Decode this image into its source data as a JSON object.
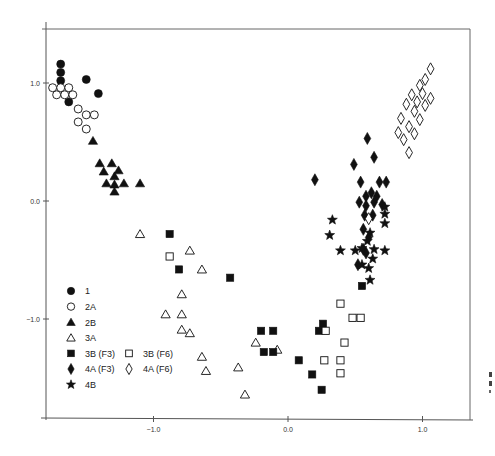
{
  "chart_data": {
    "type": "scatter",
    "title": "",
    "xlabel": "",
    "ylabel": "",
    "xlim": [
      -1.8,
      1.35
    ],
    "ylim": [
      -1.85,
      1.45
    ],
    "grid": false,
    "legend_position": "lower-left inside",
    "x_ticks": [
      {
        "value": -1.0,
        "label": "−1.0"
      },
      {
        "value": 0.0,
        "label": "0.0"
      },
      {
        "value": 1.0,
        "label": "1.0"
      }
    ],
    "y_ticks": [
      {
        "value": 1.0,
        "label": "1.0"
      },
      {
        "value": 0.0,
        "label": "0.0"
      },
      {
        "value": -1.0,
        "label": "−1.0"
      }
    ],
    "series": [
      {
        "name": "1",
        "marker": "circle",
        "filled": true,
        "points": [
          [
            -1.69,
            1.16
          ],
          [
            -1.69,
            1.09
          ],
          [
            -1.69,
            1.02
          ],
          [
            -1.5,
            1.03
          ],
          [
            -1.63,
            0.84
          ],
          [
            -1.41,
            0.91
          ]
        ]
      },
      {
        "name": "2A",
        "marker": "circle",
        "filled": false,
        "points": [
          [
            -1.75,
            0.96
          ],
          [
            -1.69,
            0.96
          ],
          [
            -1.63,
            0.96
          ],
          [
            -1.72,
            0.9
          ],
          [
            -1.66,
            0.9
          ],
          [
            -1.6,
            0.9
          ],
          [
            -1.56,
            0.78
          ],
          [
            -1.5,
            0.73
          ],
          [
            -1.44,
            0.73
          ],
          [
            -1.56,
            0.67
          ],
          [
            -1.5,
            0.61
          ]
        ]
      },
      {
        "name": "2B",
        "marker": "triangle",
        "filled": true,
        "points": [
          [
            -1.45,
            0.51
          ],
          [
            -1.4,
            0.32
          ],
          [
            -1.31,
            0.32
          ],
          [
            -1.37,
            0.25
          ],
          [
            -1.26,
            0.26
          ],
          [
            -1.35,
            0.15
          ],
          [
            -1.29,
            0.21
          ],
          [
            -1.29,
            0.14
          ],
          [
            -1.22,
            0.15
          ],
          [
            -1.1,
            0.15
          ],
          [
            -1.29,
            0.08
          ]
        ]
      },
      {
        "name": "3A",
        "marker": "triangle",
        "filled": false,
        "points": [
          [
            -1.1,
            -0.28
          ],
          [
            -0.73,
            -0.42
          ],
          [
            -0.64,
            -0.58
          ],
          [
            -0.79,
            -0.79
          ],
          [
            -0.91,
            -0.96
          ],
          [
            -0.79,
            -0.96
          ],
          [
            -0.79,
            -1.09
          ],
          [
            -0.73,
            -1.12
          ],
          [
            -0.64,
            -1.32
          ],
          [
            -0.61,
            -1.44
          ],
          [
            -0.37,
            -1.41
          ],
          [
            -0.32,
            -1.64
          ],
          [
            -0.24,
            -1.2
          ],
          [
            -0.08,
            -1.26
          ]
        ]
      },
      {
        "name": "3B (F3)",
        "marker": "square",
        "filled": true,
        "points": [
          [
            -0.88,
            -0.28
          ],
          [
            -0.81,
            -0.58
          ],
          [
            -0.43,
            -0.65
          ],
          [
            -0.2,
            -1.1
          ],
          [
            -0.11,
            -1.1
          ],
          [
            -0.18,
            -1.28
          ],
          [
            -0.11,
            -1.28
          ],
          [
            0.08,
            -1.35
          ],
          [
            0.23,
            -1.1
          ],
          [
            0.26,
            -1.04
          ],
          [
            0.18,
            -1.47
          ],
          [
            0.25,
            -1.6
          ],
          [
            0.55,
            -0.72
          ]
        ]
      },
      {
        "name": "3B (F6)",
        "marker": "square",
        "filled": false,
        "points": [
          [
            -0.88,
            -0.47
          ],
          [
            0.28,
            -1.1
          ],
          [
            0.39,
            -0.87
          ],
          [
            0.48,
            -0.99
          ],
          [
            0.54,
            -0.99
          ],
          [
            0.42,
            -1.2
          ],
          [
            0.39,
            -1.35
          ],
          [
            0.39,
            -1.46
          ],
          [
            0.27,
            -1.35
          ]
        ]
      },
      {
        "name": "4A (F3)",
        "marker": "diamond",
        "filled": true,
        "points": [
          [
            0.2,
            0.18
          ],
          [
            0.49,
            0.31
          ],
          [
            0.59,
            0.53
          ],
          [
            0.64,
            0.37
          ],
          [
            0.54,
            0.16
          ],
          [
            0.68,
            0.16
          ],
          [
            0.73,
            0.16
          ],
          [
            0.58,
            0.04
          ],
          [
            0.62,
            0.07
          ],
          [
            0.66,
            0.04
          ],
          [
            0.53,
            -0.01
          ],
          [
            0.58,
            -0.04
          ],
          [
            0.64,
            -0.01
          ],
          [
            0.57,
            -0.12
          ],
          [
            0.63,
            -0.12
          ],
          [
            0.56,
            -0.24
          ],
          [
            0.6,
            -0.31
          ],
          [
            0.56,
            -0.41
          ],
          [
            0.52,
            -0.54
          ],
          [
            0.58,
            -0.44
          ],
          [
            0.7,
            -0.03
          ]
        ]
      },
      {
        "name": "4A (F6)",
        "marker": "diamond",
        "filled": false,
        "points": [
          [
            1.06,
            1.12
          ],
          [
            1.02,
            1.03
          ],
          [
            0.98,
            0.98
          ],
          [
            1.0,
            0.91
          ],
          [
            1.06,
            0.87
          ],
          [
            0.92,
            0.9
          ],
          [
            0.96,
            0.84
          ],
          [
            1.02,
            0.81
          ],
          [
            0.88,
            0.82
          ],
          [
            0.94,
            0.76
          ],
          [
            0.98,
            0.69
          ],
          [
            0.84,
            0.7
          ],
          [
            0.9,
            0.63
          ],
          [
            0.82,
            0.58
          ],
          [
            0.94,
            0.57
          ],
          [
            0.86,
            0.52
          ],
          [
            0.9,
            0.41
          ],
          [
            0.6,
            -0.15
          ]
        ]
      },
      {
        "name": "4B",
        "marker": "star",
        "filled": true,
        "points": [
          [
            0.33,
            -0.16
          ],
          [
            0.31,
            -0.29
          ],
          [
            0.39,
            -0.42
          ],
          [
            0.55,
            -0.4
          ],
          [
            0.72,
            -0.05
          ],
          [
            0.72,
            -0.11
          ],
          [
            0.72,
            -0.19
          ],
          [
            0.61,
            -0.27
          ],
          [
            0.59,
            -0.34
          ],
          [
            0.64,
            -0.41
          ],
          [
            0.72,
            -0.42
          ],
          [
            0.63,
            -0.49
          ],
          [
            0.5,
            -0.42
          ],
          [
            0.55,
            -0.54
          ],
          [
            0.61,
            -0.67
          ],
          [
            0.6,
            -0.57
          ]
        ]
      }
    ],
    "legend": [
      {
        "label": "1",
        "marker": "circle",
        "filled": true
      },
      {
        "label": "2A",
        "marker": "circle",
        "filled": false
      },
      {
        "label": "2B",
        "marker": "triangle",
        "filled": true
      },
      {
        "label": "3A",
        "marker": "triangle",
        "filled": false
      },
      {
        "label": "3B (F3)",
        "marker": "square",
        "filled": true
      },
      {
        "label": "3B (F6)",
        "marker": "square",
        "filled": false
      },
      {
        "label": "4A (F3)",
        "marker": "diamond",
        "filled": true
      },
      {
        "label": "4A (F6)",
        "marker": "diamond",
        "filled": false
      },
      {
        "label": "4B",
        "marker": "star",
        "filled": true
      }
    ],
    "colors": {
      "marker": "#111111",
      "axis": "#555555",
      "background": "#ffffff"
    }
  }
}
